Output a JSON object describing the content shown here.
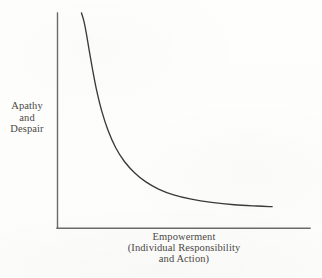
{
  "figure": {
    "background_color": "#fdfdfc",
    "axis_color": "#6a6a6a",
    "curve_color": "#3a3a3a",
    "text_color": "#4a4845"
  },
  "y_axis_label": {
    "lines": [
      "Apathy",
      "and",
      "Despair"
    ],
    "full_text": "Apathy and Despair"
  },
  "x_axis_label": {
    "lines": [
      "Empowerment",
      "(Individual Responsibility",
      "and Action)"
    ],
    "full_text": "Empowerment (Individual Responsibility and Action)"
  },
  "chart_data": {
    "type": "line",
    "title": "",
    "subtitle": "",
    "xlabel": "Empowerment (Individual Responsibility and Action)",
    "ylabel": "Apathy and Despair",
    "grid": false,
    "legend": "none",
    "axis_style": {
      "spines": [
        "left",
        "bottom"
      ],
      "ticks": false,
      "tick_labels": false,
      "xlim": [
        0,
        1
      ],
      "ylim": [
        0,
        1
      ]
    },
    "annotations": [],
    "series": [
      {
        "name": "Apathy and Despair vs Empowerment",
        "description": "Monotonically decreasing hyperbolic (inverse) relationship: apathy and despair fall steeply as empowerment rises, then flatten toward an asymptote.",
        "x": [
          0.095,
          0.105,
          0.115,
          0.125,
          0.14,
          0.155,
          0.175,
          0.2,
          0.23,
          0.265,
          0.305,
          0.35,
          0.4,
          0.46,
          0.53,
          0.61,
          0.7,
          0.79,
          0.85
        ],
        "y": [
          1.0,
          0.96,
          0.9,
          0.83,
          0.73,
          0.64,
          0.545,
          0.455,
          0.375,
          0.31,
          0.258,
          0.215,
          0.182,
          0.155,
          0.135,
          0.12,
          0.109,
          0.103,
          0.1
        ]
      }
    ]
  }
}
